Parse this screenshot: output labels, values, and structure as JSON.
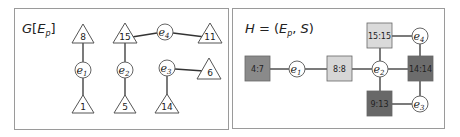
{
  "left_panel": {
    "title_main": "G",
    "title_open": "[",
    "title_E": "E",
    "title_sub": "p",
    "title_close": "]",
    "triangles": [
      {
        "id": "t8",
        "label": "8"
      },
      {
        "id": "t1",
        "label": "1"
      },
      {
        "id": "t15",
        "label": "15"
      },
      {
        "id": "t5",
        "label": "5"
      },
      {
        "id": "t11",
        "label": "11"
      },
      {
        "id": "t6",
        "label": "6"
      },
      {
        "id": "t14",
        "label": "14"
      }
    ],
    "circles": [
      {
        "id": "e1",
        "base": "e",
        "sub": "1"
      },
      {
        "id": "e2",
        "base": "e",
        "sub": "2"
      },
      {
        "id": "e3",
        "base": "e",
        "sub": "3"
      },
      {
        "id": "e4",
        "base": "e",
        "sub": "4"
      }
    ],
    "edges": [
      [
        "8",
        "e1"
      ],
      [
        "e1",
        "1"
      ],
      [
        "15",
        "e2"
      ],
      [
        "e2",
        "5"
      ],
      [
        "15",
        "e4"
      ],
      [
        "e4",
        "11"
      ],
      [
        "e3",
        "6"
      ],
      [
        "e3",
        "14"
      ]
    ]
  },
  "right_panel": {
    "title_H": "H",
    "title_eq": " = (",
    "title_E": "E",
    "title_sub": "p",
    "title_comma": ", ",
    "title_S": "S",
    "title_close": ")",
    "squares": [
      {
        "id": "s47",
        "label": "4:7",
        "color": "#8a8a8a"
      },
      {
        "id": "s88",
        "label": "8:8",
        "color": "#d6d6d6"
      },
      {
        "id": "s1515",
        "label": "15:15",
        "color": "#dadada"
      },
      {
        "id": "s1414",
        "label": "14:14",
        "color": "#6c6c6c"
      },
      {
        "id": "s913",
        "label": "9:13",
        "color": "#686868"
      }
    ],
    "circles": [
      {
        "id": "e1",
        "base": "e",
        "sub": "1"
      },
      {
        "id": "e2",
        "base": "e",
        "sub": "2"
      },
      {
        "id": "e3",
        "base": "e",
        "sub": "3"
      },
      {
        "id": "e4",
        "base": "e",
        "sub": "4"
      }
    ],
    "edges": [
      [
        "4:7",
        "e1"
      ],
      [
        "e1",
        "8:8"
      ],
      [
        "8:8",
        "e2"
      ],
      [
        "e2",
        "15:15"
      ],
      [
        "e2",
        "14:14"
      ],
      [
        "e2",
        "9:13"
      ],
      [
        "15:15",
        "e4"
      ],
      [
        "e4",
        "14:14"
      ],
      [
        "14:14",
        "e3"
      ],
      [
        "9:13",
        "e3"
      ]
    ]
  }
}
